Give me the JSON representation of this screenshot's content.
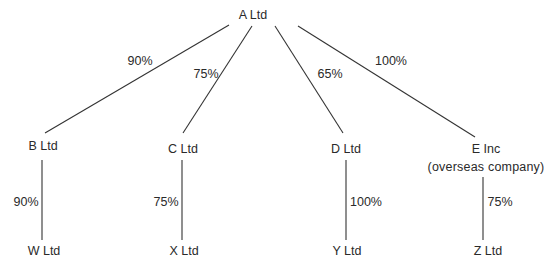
{
  "diagram": {
    "type": "group-structure",
    "parent": {
      "id": "A",
      "label": "A Ltd"
    },
    "subsidiaries": [
      {
        "id": "B",
        "label": "B Ltd",
        "holding": "90%",
        "parent": "A"
      },
      {
        "id": "C",
        "label": "C Ltd",
        "holding": "75%",
        "parent": "A"
      },
      {
        "id": "D",
        "label": "D Ltd",
        "holding": "65%",
        "parent": "A"
      },
      {
        "id": "E",
        "label": "E Inc",
        "note": "(overseas company)",
        "holding": "100%",
        "parent": "A"
      }
    ],
    "sub_subsidiaries": [
      {
        "id": "W",
        "label": "W Ltd",
        "holding": "90%",
        "parent": "B"
      },
      {
        "id": "X",
        "label": "X Ltd",
        "holding": "75%",
        "parent": "C"
      },
      {
        "id": "Y",
        "label": "Y Ltd",
        "holding": "100%",
        "parent": "D"
      },
      {
        "id": "Z",
        "label": "Z Ltd",
        "holding": "75%",
        "parent": "E"
      }
    ]
  }
}
